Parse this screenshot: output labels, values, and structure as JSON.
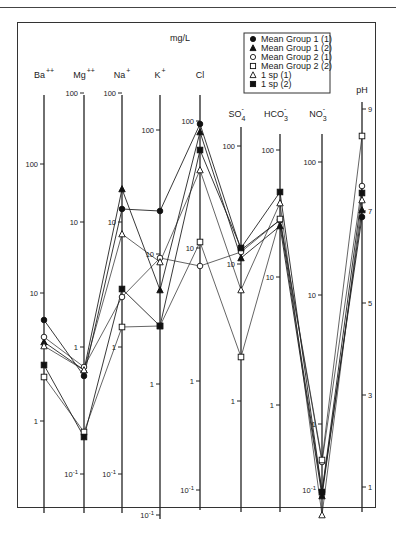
{
  "chart_data": {
    "type": "line",
    "title": "",
    "unit_label": "mg/L",
    "ylabel_right": "pH",
    "categories": [
      "Ba++",
      "Mg++",
      "Na+",
      "K+",
      "Cl",
      "SO4-",
      "HCO3-",
      "NO3-",
      "pH"
    ],
    "axes": [
      {
        "name": "Ba",
        "sup": "++",
        "sub": "",
        "x": 44,
        "scale": "log",
        "ticks": [
          {
            "label": "100",
            "v": 100,
            "y": 164
          },
          {
            "label": "10",
            "v": 10,
            "y": 293
          },
          {
            "label": "1",
            "v": 1,
            "y": 421
          }
        ],
        "top": 95,
        "bottom": 513
      },
      {
        "name": "Mg",
        "sup": "++",
        "sub": "",
        "x": 84,
        "scale": "log",
        "ticks": [
          {
            "label": "100",
            "v": 100,
            "y": 93
          },
          {
            "label": "10",
            "v": 10,
            "y": 222
          },
          {
            "label": "1",
            "v": 1,
            "y": 347
          },
          {
            "label": "10 -1",
            "v": 0.1,
            "y": 474
          }
        ],
        "top": 95,
        "bottom": 513
      },
      {
        "name": "Na",
        "sup": "+",
        "sub": "",
        "x": 122,
        "scale": "log",
        "ticks": [
          {
            "label": "100",
            "v": 100,
            "y": 93
          },
          {
            "label": "10",
            "v": 10,
            "y": 222
          },
          {
            "label": "1",
            "v": 1,
            "y": 347
          },
          {
            "label": "10 -1",
            "v": 0.1,
            "y": 474
          }
        ],
        "top": 95,
        "bottom": 513
      },
      {
        "name": "K",
        "sup": "+",
        "sub": "",
        "x": 160,
        "scale": "log",
        "ticks": [
          {
            "label": "100",
            "v": 100,
            "y": 130
          },
          {
            "label": "10",
            "v": 10,
            "y": 254
          },
          {
            "label": "1",
            "v": 1,
            "y": 384
          },
          {
            "label": "10 -1",
            "v": 0.1,
            "y": 515
          }
        ],
        "top": 95,
        "bottom": 519
      },
      {
        "name": "Cl",
        "sup": "",
        "sub": "",
        "x": 200,
        "scale": "log",
        "ticks": [
          {
            "label": "100",
            "v": 100,
            "y": 121
          },
          {
            "label": "10",
            "v": 10,
            "y": 248
          },
          {
            "label": "1",
            "v": 1,
            "y": 381
          },
          {
            "label": "10 -1",
            "v": 0.1,
            "y": 490
          }
        ],
        "top": 95,
        "bottom": 510
      },
      {
        "name": "SO",
        "sup": "-",
        "sub": "4",
        "x": 241,
        "scale": "log",
        "ticks": [
          {
            "label": "100",
            "v": 100,
            "y": 146
          },
          {
            "label": "10",
            "v": 10,
            "y": 264
          },
          {
            "label": "1",
            "v": 1,
            "y": 401
          }
        ],
        "top": 127,
        "bottom": 512
      },
      {
        "name": "HCO",
        "sup": "-",
        "sub": "3",
        "x": 280,
        "scale": "log",
        "ticks": [
          {
            "label": "100",
            "v": 100,
            "y": 150
          },
          {
            "label": "10",
            "v": 10,
            "y": 277
          },
          {
            "label": "1",
            "v": 1,
            "y": 405
          }
        ],
        "top": 134,
        "bottom": 512
      },
      {
        "name": "NO",
        "sup": "-",
        "sub": "3",
        "x": 322,
        "scale": "log",
        "ticks": [
          {
            "label": "100",
            "v": 100,
            "y": 162
          },
          {
            "label": "10",
            "v": 10,
            "y": 295
          },
          {
            "label": "1",
            "v": 1,
            "y": 424
          },
          {
            "label": "10 -1",
            "v": 0.1,
            "y": 490
          }
        ],
        "top": 134,
        "bottom": 512
      },
      {
        "name": "pH",
        "sup": "",
        "sub": "",
        "x": 362,
        "scale": "linear",
        "ticks": [
          {
            "label": "9",
            "v": 9,
            "y": 109
          },
          {
            "label": "7",
            "v": 7,
            "y": 211
          },
          {
            "label": "5",
            "v": 5,
            "y": 303
          },
          {
            "label": "3",
            "v": 3,
            "y": 395
          },
          {
            "label": "1",
            "v": 1,
            "y": 487
          }
        ],
        "top": 102,
        "bottom": 512
      }
    ],
    "series": [
      {
        "name": "Mean Group 1 (1)",
        "marker": "circle-filled",
        "values": [
          6.0,
          0.3,
          8.0,
          7.5,
          110,
          14,
          35,
          0.55,
          7.0
        ],
        "points_y": [
          320,
          376,
          209,
          211,
          124,
          250,
          220,
          492,
          217
        ]
      },
      {
        "name": "Mean Group 1 (2)",
        "marker": "triangle-filled",
        "values": [
          3.8,
          0.38,
          60,
          1.1,
          85,
          12,
          28,
          0.5,
          7.1
        ],
        "points_y": [
          342,
          370,
          189,
          290,
          132,
          258,
          226,
          496,
          210
        ]
      },
      {
        "name": "Mean Group 2 (1)",
        "marker": "circle-open",
        "values": [
          4.2,
          0.42,
          4.5,
          2.7,
          17,
          20,
          36,
          1.5,
          7.6
        ],
        "points_y": [
          337,
          367,
          297,
          258,
          266,
          252,
          220,
          462,
          186
        ]
      },
      {
        "name": "Mean Group 2 (2)",
        "marker": "square-open",
        "values": [
          1.7,
          0.15,
          2.2,
          5.4,
          20,
          2.1,
          37,
          1.6,
          8.5
        ],
        "points_y": [
          377,
          432,
          327,
          326,
          242,
          357,
          219,
          460,
          136
        ]
      },
      {
        "name": "1 sp (1)",
        "marker": "triangle-open",
        "values": [
          3.6,
          0.37,
          24,
          5.5,
          60,
          8.5,
          55,
          0.35,
          7.3
        ],
        "points_y": [
          346,
          370,
          234,
          262,
          170,
          290,
          203,
          515,
          200
        ]
      },
      {
        "name": "1 sp (2)",
        "marker": "square-filled",
        "values": [
          2.4,
          0.14,
          5.8,
          5.4,
          150,
          15,
          75,
          0.55,
          7.4
        ],
        "points_y": [
          365,
          437,
          289,
          326,
          150,
          248,
          192,
          492,
          193
        ]
      }
    ],
    "legend_position": "top-right",
    "grid": false
  },
  "legend": {
    "items": [
      {
        "label": "Mean Group 1 (1)",
        "marker": "circle-filled"
      },
      {
        "label": "Mean Group 1 (2)",
        "marker": "triangle-filled"
      },
      {
        "label": "Mean Group 2 (1)",
        "marker": "circle-open"
      },
      {
        "label": "Mean Group 2 (2)",
        "marker": "square-open"
      },
      {
        "label": "1 sp (1)",
        "marker": "triangle-open"
      },
      {
        "label": "1 sp (2)",
        "marker": "square-filled"
      }
    ]
  },
  "labels": {
    "unit": "mg/L",
    "ph": "pH"
  }
}
